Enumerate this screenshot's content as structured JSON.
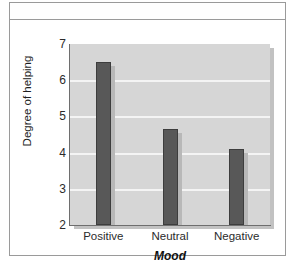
{
  "figure": {
    "background_color": "#ffffff",
    "border_color": "#9a9a9a"
  },
  "chart_data": {
    "type": "bar",
    "title": "",
    "subtitle": "",
    "categories": [
      "Positive",
      "Neutral",
      "Negative"
    ],
    "values": [
      6.5,
      4.65,
      4.1
    ],
    "series": [
      {
        "name": "Degree of helping",
        "values": [
          6.5,
          4.65,
          4.1
        ]
      }
    ],
    "xlabel": "Mood",
    "ylabel": "Degree of helping",
    "ylim": [
      2,
      7
    ],
    "yticks": [
      2,
      3,
      4,
      5,
      6,
      7
    ],
    "ytick_labels": [
      "2",
      "3",
      "4",
      "5",
      "6",
      "7"
    ],
    "xtick_labels": [
      "Positive",
      "Neutral",
      "Negative"
    ],
    "gridlines": [
      3,
      4,
      5,
      6
    ],
    "grid": true,
    "grid_color": "#f4f4f4",
    "legend": false,
    "legend_position": "none",
    "bar_color": "#585858",
    "plot_background_color": "#d6d6d6",
    "annotations": []
  },
  "axis": {
    "y_title": "Degree of helping",
    "x_title": "Mood",
    "ticks": {
      "y": [
        "7",
        "6",
        "5",
        "4",
        "3",
        "2"
      ],
      "x": [
        "Positive",
        "Neutral",
        "Negative"
      ]
    }
  }
}
